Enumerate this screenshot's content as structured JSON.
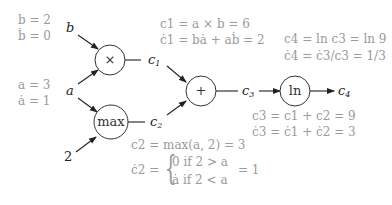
{
  "diagram": {
    "type": "computational-graph",
    "inputs": {
      "b": {
        "label": "b",
        "value_text": "b = 2",
        "deriv_text": "ḃ = 0"
      },
      "a": {
        "label": "a",
        "value_text": "a = 3",
        "deriv_text": "ȧ = 1"
      },
      "const": {
        "label": "2"
      }
    },
    "nodes": {
      "mul": {
        "op": "×"
      },
      "max": {
        "op": "max"
      },
      "add": {
        "op": "+"
      },
      "ln": {
        "op": "ln"
      }
    },
    "edge_labels": {
      "c1": "c1",
      "c2": "c2",
      "c3": "c3",
      "c4": "c4"
    },
    "annotations": {
      "c1_value": "c1 = a × b = 6",
      "c1_deriv": "ċ1 = bȧ + aḃ = 2",
      "c4_value": "c4 = ln c3 = ln 9",
      "c4_deriv": "ċ4 = ċ3/c3 = 1/3",
      "c3_value": "c3 = c1 + c2 = 9",
      "c3_deriv": "ċ3 = ċ1 + ċ2 = 3",
      "c2_value": "c2 = max(a, 2) = 3",
      "c2_deriv_lhs": "ċ2 =",
      "c2_case1": "0   if 2 > a",
      "c2_case2": "ȧ   if 2 < a",
      "c2_deriv_rhs": "= 1"
    },
    "colors": {
      "graph": "#222222",
      "annotation": "#9a9a9a"
    }
  }
}
